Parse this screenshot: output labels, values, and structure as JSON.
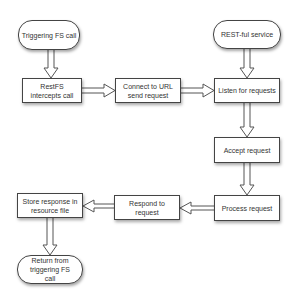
{
  "diagram": {
    "type": "flowchart",
    "nodes": [
      {
        "id": "trigger",
        "shape": "terminal",
        "label": "Triggering FS call"
      },
      {
        "id": "intercept",
        "shape": "process",
        "label": "RestFS intercepts call"
      },
      {
        "id": "connect",
        "shape": "process",
        "label": "Connect to URL send request"
      },
      {
        "id": "service",
        "shape": "terminal",
        "label": "REST-ful service"
      },
      {
        "id": "listen",
        "shape": "process",
        "label": "Listen for requests"
      },
      {
        "id": "accept",
        "shape": "process",
        "label": "Accept request"
      },
      {
        "id": "process",
        "shape": "process",
        "label": "Process request"
      },
      {
        "id": "respond",
        "shape": "process",
        "label": "Respond to request"
      },
      {
        "id": "store",
        "shape": "process",
        "label": "Store response in resource file"
      },
      {
        "id": "return",
        "shape": "terminal",
        "label": "Return from triggering FS call"
      }
    ],
    "edges": [
      {
        "from": "trigger",
        "to": "intercept"
      },
      {
        "from": "intercept",
        "to": "connect"
      },
      {
        "from": "connect",
        "to": "listen"
      },
      {
        "from": "service",
        "to": "listen"
      },
      {
        "from": "listen",
        "to": "accept"
      },
      {
        "from": "accept",
        "to": "process"
      },
      {
        "from": "process",
        "to": "respond"
      },
      {
        "from": "respond",
        "to": "store"
      },
      {
        "from": "store",
        "to": "return"
      }
    ],
    "colors": {
      "stroke": "#444444",
      "fill": "#ffffff",
      "text": "#333333"
    }
  }
}
